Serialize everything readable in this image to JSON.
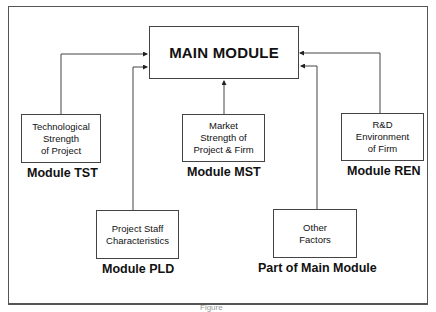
{
  "diagram": {
    "main_module": {
      "title": "MAIN MODULE"
    },
    "modules": [
      {
        "id": "tst",
        "box_lines": [
          "Technological",
          "Strength",
          "of Project"
        ],
        "label": "Module TST"
      },
      {
        "id": "mst",
        "box_lines": [
          "Market",
          "Strength of",
          "Project & Firm"
        ],
        "label": "Module MST"
      },
      {
        "id": "ren",
        "box_lines": [
          "R&D",
          "Environment",
          "of Firm"
        ],
        "label": "Module REN"
      },
      {
        "id": "pld",
        "box_lines": [
          "Project Staff",
          "Characteristics"
        ],
        "label": "Module PLD"
      },
      {
        "id": "other",
        "box_lines": [
          "Other",
          "Factors"
        ],
        "label": "Part of Main Module"
      }
    ],
    "caption": "Figure"
  }
}
